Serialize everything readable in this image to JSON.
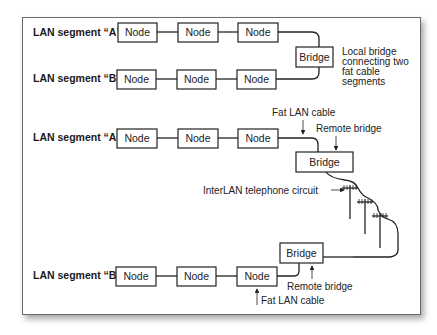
{
  "diagram": {
    "local": {
      "segment_a_label": "LAN segment “A”",
      "segment_b_label": "LAN segment “B”",
      "node_label": "Node",
      "bridge_label": "Bridge",
      "annotation": [
        "Local bridge",
        "connecting two",
        "fat cable",
        "segments"
      ]
    },
    "remote": {
      "segment_a_label": "LAN segment “A”",
      "segment_b_label": "LAN segment “B”",
      "node_label": "Node",
      "bridge_a_label": "Bridge",
      "bridge_b_label": "Bridge",
      "fat_cable_top": "Fat LAN cable",
      "remote_bridge_top": "Remote bridge",
      "interlan_circuit": "InterLAN telephone circuit",
      "remote_bridge_bottom": "Remote bridge",
      "fat_cable_bottom": "Fat LAN cable"
    }
  }
}
